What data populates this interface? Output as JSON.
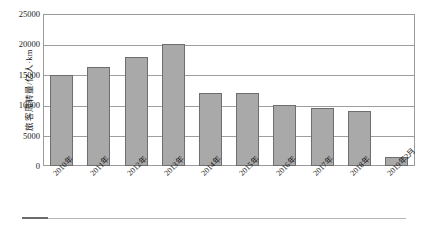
{
  "chart_data": {
    "type": "bar",
    "title": "",
    "xlabel": "",
    "ylabel": "旅客周转量/亿人·km",
    "ylim": [
      0,
      25000
    ],
    "yticks": [
      0,
      5000,
      10000,
      15000,
      20000,
      25000
    ],
    "ytick_labels": [
      "0",
      "5000",
      "10000",
      "15000",
      "20000",
      "25000"
    ],
    "grid": "horizontal",
    "legend": "none",
    "categories": [
      "2010年",
      "2011年",
      "2012年",
      "2013年",
      "2014年",
      "2015年",
      "2016年",
      "2017年",
      "2018年",
      "2019年2月"
    ],
    "values": [
      15000,
      16300,
      18000,
      20000,
      12000,
      12000,
      10000,
      9600,
      9000,
      1500
    ],
    "series": [
      {
        "name": "旅客周转量",
        "values": [
          15000,
          16300,
          18000,
          20000,
          12000,
          12000,
          10000,
          9600,
          9000,
          1500
        ]
      }
    ],
    "colors": {
      "bar_fill": "#a9a9a9",
      "bar_border": "#6e6e6e",
      "gridline": "#9e9e9e",
      "axis": "#9a9a9a",
      "text": "#1a1a1a",
      "background": "#ffffff"
    }
  }
}
